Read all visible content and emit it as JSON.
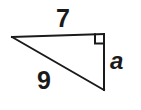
{
  "figure": {
    "name": "right-triangle-diagram",
    "background_color": "#ffffff",
    "stroke_color": "#1a1a1a",
    "text_color": "#1a1a1a",
    "stroke_width": 2
  },
  "labels": {
    "top_side": "7",
    "hypotenuse": "9",
    "vertical_side": "a"
  },
  "geometry": {
    "vertices": {
      "left": {
        "x": 12,
        "y": 37
      },
      "top_right": {
        "x": 104,
        "y": 34
      },
      "bottom_right": {
        "x": 104,
        "y": 90
      }
    },
    "right_angle_marker": {
      "corner": "top_right",
      "size": 10
    }
  },
  "icons": {
    "right_angle": "right-angle-marker-icon"
  }
}
